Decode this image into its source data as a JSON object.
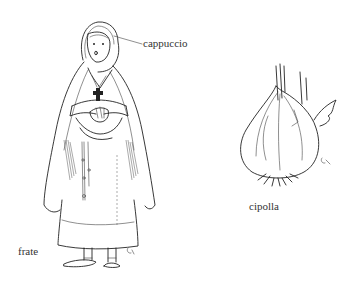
{
  "illustration": {
    "figures": [
      {
        "id": "friar",
        "depicts": "friar in hooded cloak with cross pendant, rope belt and sandals",
        "label": "frate",
        "parts": [
          {
            "name": "hood",
            "label": "cappuccio"
          }
        ]
      },
      {
        "id": "onion",
        "depicts": "onion bulb with roots and leaves",
        "label": "cipolla"
      }
    ]
  },
  "labels": {
    "hood": "cappuccio",
    "friar": "frate",
    "onion": "cipolla"
  },
  "colors": {
    "ink": "#222222",
    "background": "#ffffff",
    "label_text": "#333333"
  }
}
